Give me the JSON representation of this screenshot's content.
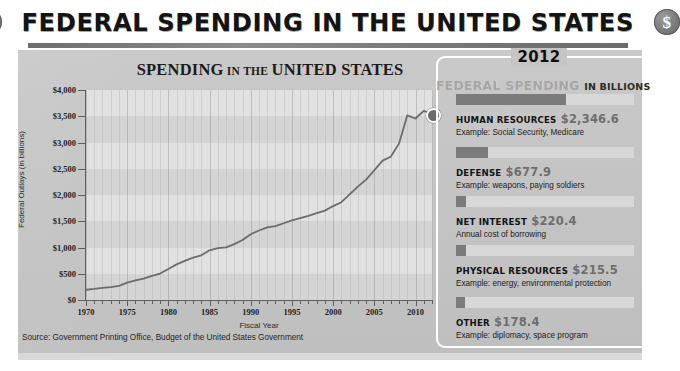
{
  "header": {
    "title": "FEDERAL SPENDING IN THE UNITED STATES",
    "left_coin_icon": "dollar-coin-icon",
    "right_coin_icon": "dollar-coin-icon",
    "coin_glyph": "$"
  },
  "chart_data": {
    "type": "line",
    "title_main": "SPENDING",
    "title_small": "IN THE",
    "title_tail": "UNITED STATES",
    "title": "SPENDING IN THE UNITED STATES",
    "xlabel": "Fiscal Year",
    "ylabel": "Federal Outlays (in billions)",
    "xlim": [
      1970,
      2012
    ],
    "ylim": [
      0,
      4000
    ],
    "grid": true,
    "legend": "none",
    "ytick_labels": [
      "$4,000",
      "$3,500",
      "$3,000",
      "$2,500",
      "$2,000",
      "$1,500",
      "$1,000",
      "$500",
      "$0"
    ],
    "ytick_values": [
      4000,
      3500,
      3000,
      2500,
      2000,
      1500,
      1000,
      500,
      0
    ],
    "xtick_labels": [
      "1970",
      "1975",
      "1980",
      "1985",
      "1990",
      "1995",
      "2000",
      "2005",
      "2010"
    ],
    "xtick_values": [
      1970,
      1975,
      1980,
      1985,
      1990,
      1995,
      2000,
      2005,
      2010
    ],
    "series": [
      {
        "name": "Federal Outlays",
        "x": [
          1970,
          1971,
          1972,
          1973,
          1974,
          1975,
          1976,
          1977,
          1978,
          1979,
          1980,
          1981,
          1982,
          1983,
          1984,
          1985,
          1986,
          1987,
          1988,
          1989,
          1990,
          1991,
          1992,
          1993,
          1994,
          1995,
          1996,
          1997,
          1998,
          1999,
          2000,
          2001,
          2002,
          2003,
          2004,
          2005,
          2006,
          2007,
          2008,
          2009,
          2010,
          2011,
          2012
        ],
        "values": [
          195,
          210,
          231,
          246,
          269,
          332,
          372,
          409,
          459,
          504,
          591,
          678,
          746,
          808,
          852,
          946,
          990,
          1004,
          1064,
          1143,
          1253,
          1324,
          1382,
          1409,
          1462,
          1516,
          1561,
          1601,
          1653,
          1702,
          1789,
          1863,
          2011,
          2160,
          2293,
          2472,
          2655,
          2729,
          2983,
          3518,
          3457,
          3603,
          3538
        ]
      }
    ],
    "end_marker": {
      "label": "2012-endpoint-dot",
      "x": 2012,
      "y": 3538
    }
  },
  "source": {
    "text": "Source: Government Printing Office, Budget of the United States Government"
  },
  "callout": {
    "year": "2012",
    "subtitle_big": "FEDERAL SPENDING",
    "subtitle_small": "IN BILLIONS",
    "max_value": 2346.6,
    "categories": [
      {
        "name": "HUMAN RESOURCES",
        "value_label": "$2,346.6",
        "value": 2346.6,
        "example": "Example: Social Security, Medicare"
      },
      {
        "name": "DEFENSE",
        "value_label": "$677.9",
        "value": 677.9,
        "example": "Example: weapons, paying soldiers"
      },
      {
        "name": "NET INTEREST",
        "value_label": "$220.4",
        "value": 220.4,
        "example": "Annual cost of borrowing"
      },
      {
        "name": "PHYSICAL RESOURCES",
        "value_label": "$215.5",
        "value": 215.5,
        "example": "Example: energy, environmental protection"
      },
      {
        "name": "OTHER",
        "value_label": "$178.4",
        "value": 178.4,
        "example": "Example: diplomacy, space program"
      }
    ]
  },
  "colors": {
    "panel_bg": "#c4c4c4",
    "plot_bg": "#d4d4d4",
    "line": "#6b6b6b",
    "bar_fill": "#7b7b7b",
    "bar_track": "#d8d8d8",
    "value_text": "#6e6e6e",
    "accent_white": "#ffffff"
  }
}
